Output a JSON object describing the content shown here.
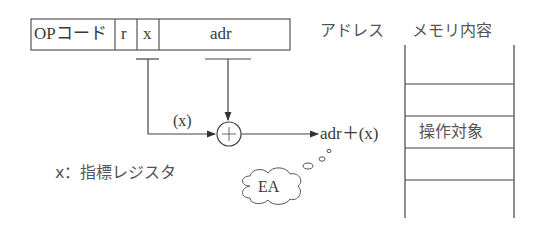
{
  "instruction_format": {
    "fields": [
      {
        "id": "op",
        "label": "OPコード"
      },
      {
        "id": "r",
        "label": "r"
      },
      {
        "id": "x",
        "label": "x"
      },
      {
        "id": "adr",
        "label": "adr"
      }
    ]
  },
  "adder": {
    "input_label": "(x)",
    "symbol": "+",
    "output_label": "adr＋(x)"
  },
  "legend": {
    "text": "x：指標レジスタ"
  },
  "memory": {
    "address_header": "アドレス",
    "content_header": "メモリ内容",
    "cells": [
      "",
      "",
      "操作対象",
      "",
      ""
    ],
    "target_cell_index": 2
  },
  "thought_bubble": {
    "text": "EA"
  },
  "colors": {
    "line": "#444444",
    "text": "#3a3a3a",
    "background": "#ffffff"
  }
}
